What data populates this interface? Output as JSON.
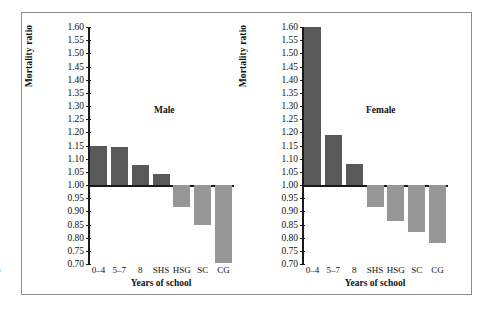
{
  "margin_glyph": "s",
  "figure": {
    "panels": [
      "male",
      "female"
    ]
  },
  "chart_data": [
    {
      "type": "bar",
      "title": "Male",
      "xlabel": "Years of school",
      "ylabel": "Mortality ratio",
      "categories": [
        "0–4",
        "5–7",
        "8",
        "SHS",
        "HSG",
        "SC",
        "CG"
      ],
      "values": [
        1.15,
        1.145,
        1.075,
        1.04,
        0.915,
        0.85,
        0.705
      ],
      "baseline": 1.0,
      "ylim": [
        0.7,
        1.6
      ],
      "ytick_step": 0.05,
      "ytick_labels": [
        "1.60",
        "1.55",
        "1.50",
        "1.45",
        "1.40",
        "1.35",
        "1.30",
        "1.25",
        "1.20",
        "1.15",
        "1.10",
        "1.05",
        "1.00",
        "0.95",
        "0.90",
        "0.85",
        "0.80",
        "0.75",
        "0.70"
      ],
      "grid": false,
      "legend": null,
      "colors": {
        "above_baseline": "#595959",
        "below_baseline": "#969696"
      }
    },
    {
      "type": "bar",
      "title": "Female",
      "xlabel": "Years of school",
      "ylabel": "Mortality ratio",
      "categories": [
        "0–4",
        "5–7",
        "8",
        "SHS",
        "HSG",
        "SC",
        "CG"
      ],
      "values": [
        1.6,
        1.19,
        1.08,
        0.915,
        0.865,
        0.82,
        0.78
      ],
      "baseline": 1.0,
      "ylim": [
        0.7,
        1.6
      ],
      "ytick_step": 0.05,
      "ytick_labels": [
        "1.60",
        "1.55",
        "1.50",
        "1.45",
        "1.40",
        "1.35",
        "1.30",
        "1.25",
        "1.20",
        "1.15",
        "1.10",
        "1.05",
        "1.00",
        "0.95",
        "0.90",
        "0.85",
        "0.80",
        "0.75",
        "0.70"
      ],
      "grid": false,
      "legend": null,
      "colors": {
        "above_baseline": "#595959",
        "below_baseline": "#969696"
      }
    }
  ]
}
